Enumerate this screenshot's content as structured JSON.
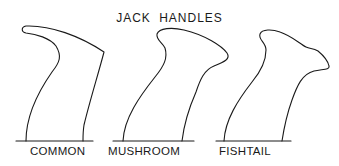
{
  "title": "JACK HANDLES",
  "handles": [
    {
      "name": "COMMON"
    },
    {
      "name": "MUSHROOM"
    },
    {
      "name": "FISHTAIL"
    }
  ],
  "colors": {
    "ink": "#1a1a1a",
    "background": "#ffffff"
  }
}
